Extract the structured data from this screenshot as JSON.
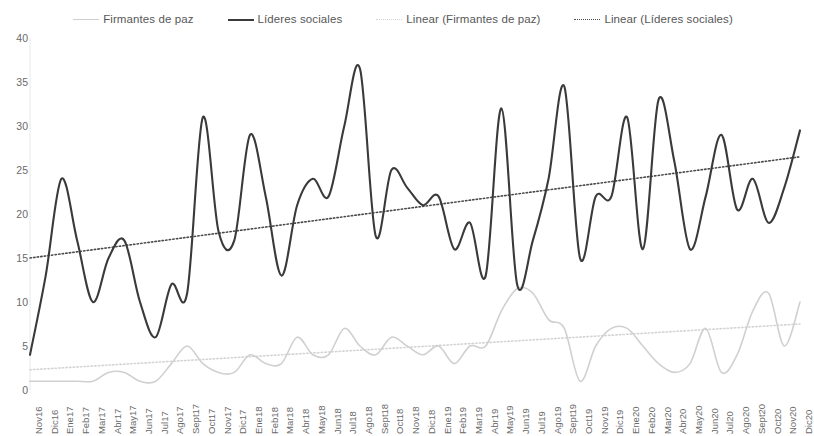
{
  "legend": {
    "items": [
      {
        "label": "Firmantes de paz",
        "style": "solid-thin",
        "color": "#cfcfcf"
      },
      {
        "label": "Líderes sociales",
        "style": "solid-thick",
        "color": "#3a3a3a"
      },
      {
        "label": "Linear (Firmantes de paz)",
        "style": "dotted",
        "color": "#d4d4d4"
      },
      {
        "label": "Linear (Líderes sociales)",
        "style": "dotted",
        "color": "#4a4a4a"
      }
    ]
  },
  "chart_data": {
    "type": "line",
    "title": "",
    "subtitle": "",
    "xlabel": "",
    "ylabel": "",
    "ylim": [
      0,
      40
    ],
    "ytick_step": 5,
    "yticks": [
      0,
      5,
      10,
      15,
      20,
      25,
      30,
      35,
      40
    ],
    "grid": false,
    "legend_position": "top",
    "categories": [
      "Nov16",
      "Dic16",
      "Ene17",
      "Feb17",
      "Mar17",
      "Abr17",
      "May17",
      "Jun17",
      "Jul17",
      "Ago17",
      "Sept17",
      "Oct17",
      "Nov17",
      "Dic17",
      "Ene18",
      "Feb18",
      "Mar18",
      "Abr18",
      "May18",
      "Jun18",
      "Jul18",
      "Ago18",
      "Sept18",
      "Oct18",
      "Nov18",
      "Dic18",
      "Ene19",
      "Feb19",
      "Mar19",
      "Abr19",
      "May19",
      "Jun19",
      "Jul19",
      "Ago19",
      "Sept19",
      "Oct19",
      "Nov19",
      "Dic19",
      "Ene20",
      "Feb20",
      "Mar20",
      "Abr20",
      "May20",
      "Jun20",
      "Jul20",
      "Ago20",
      "Sept20",
      "Oct20",
      "Nov20",
      "Dic20"
    ],
    "series": [
      {
        "name": "Líderes sociales",
        "color": "#3a3a3a",
        "style": "solid",
        "width": 2.1,
        "smooth": true,
        "values": [
          4,
          13,
          24,
          17,
          10,
          15,
          17,
          10,
          6,
          12,
          11,
          31,
          18,
          17,
          29,
          22,
          13,
          21,
          24,
          22,
          30,
          36.5,
          17.5,
          25,
          23,
          21,
          22,
          16,
          19,
          13,
          32,
          12,
          17,
          24,
          34.5,
          15,
          22,
          22,
          31,
          16,
          33,
          26,
          16,
          22,
          29,
          20.5,
          24,
          19,
          23,
          29.5
        ]
      },
      {
        "name": "Firmantes de paz",
        "color": "#d0d0d0",
        "style": "solid",
        "width": 1.6,
        "smooth": true,
        "values": [
          1,
          1,
          1,
          1,
          1,
          2,
          2,
          1,
          1,
          3,
          5,
          3,
          2,
          2,
          4,
          3,
          3,
          6,
          4,
          4,
          7,
          5,
          4,
          6,
          5,
          4,
          5,
          3,
          5,
          5,
          9,
          11.5,
          11,
          8,
          7,
          1,
          5,
          7,
          7,
          5,
          3,
          2,
          3,
          7,
          2,
          4,
          9,
          11,
          5,
          10
        ]
      }
    ],
    "trendlines": [
      {
        "name": "Linear (Líderes sociales)",
        "color": "#4a4a4a",
        "style": "dotted",
        "width": 1.6,
        "y_start": 15.0,
        "y_end": 26.5
      },
      {
        "name": "Linear (Firmantes de paz)",
        "color": "#d4d4d4",
        "style": "dotted",
        "width": 1.6,
        "y_start": 2.3,
        "y_end": 7.5
      }
    ]
  },
  "plot_geometry": {
    "left": 30,
    "right": 800,
    "top": 38,
    "bottom": 390
  }
}
